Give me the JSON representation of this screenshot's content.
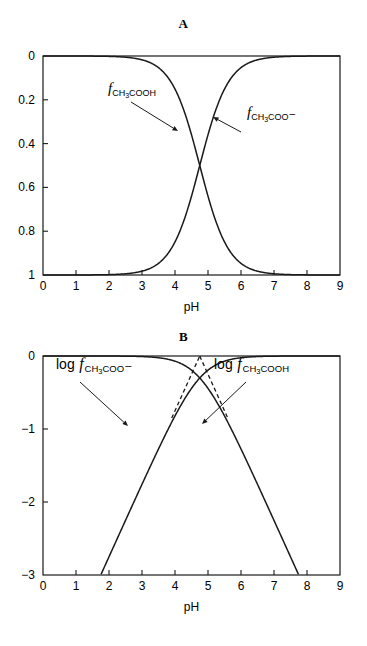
{
  "figure": {
    "panels": [
      {
        "id": "A",
        "title": "A",
        "xlabel": "pH",
        "ylabel": "",
        "labels": [
          {
            "prefix": "",
            "f": "f",
            "formula_main_1": "CH",
            "formula_digit": "3",
            "formula_main_2": "COOH",
            "charge": ""
          },
          {
            "prefix": "",
            "f": "f",
            "formula_main_1": "CH",
            "formula_digit": "3",
            "formula_main_2": "COO",
            "charge": "–"
          }
        ]
      },
      {
        "id": "B",
        "title": "B",
        "xlabel": "pH",
        "ylabel": "",
        "labels": [
          {
            "prefix": "log",
            "f": "f",
            "formula_main_1": "CH",
            "formula_digit": "3",
            "formula_main_2": "COO",
            "charge": "–"
          },
          {
            "prefix": "log",
            "f": "f",
            "formula_main_1": "CH",
            "formula_digit": "3",
            "formula_main_2": "COOH",
            "charge": ""
          }
        ]
      }
    ]
  },
  "chart_data": [
    {
      "type": "line",
      "title": "A",
      "xlabel": "pH",
      "ylabel": "",
      "xlim": [
        0,
        9
      ],
      "ylim": [
        0,
        1
      ],
      "xticks": [
        "0",
        "1",
        "2",
        "3",
        "4",
        "5",
        "6",
        "7",
        "8",
        "9"
      ],
      "yticks": [
        "0",
        "0.2",
        "0.4",
        "0.6",
        "0.8",
        "1"
      ],
      "grid": false,
      "legend_position": "inline-annotation",
      "pKa": 4.75,
      "series": [
        {
          "name": "f_CH3COOH",
          "label_plain": "f CH3COOH",
          "x": [
            0,
            0.5,
            1,
            1.5,
            2,
            2.5,
            3,
            3.25,
            3.5,
            3.75,
            4,
            4.25,
            4.5,
            4.75,
            5,
            5.25,
            5.5,
            5.75,
            6,
            6.25,
            6.5,
            7,
            7.5,
            8,
            8.5,
            9
          ],
          "values": [
            1.0,
            0.9999,
            0.9994,
            0.9982,
            0.9944,
            0.9824,
            0.949,
            0.9194,
            0.8762,
            0.8169,
            0.7403,
            0.6491,
            0.5498,
            0.5,
            0.3597,
            0.2401,
            0.1512,
            0.0909,
            0.0532,
            0.0306,
            0.0174,
            0.0056,
            0.0018,
            0.00056,
            0.00018,
            6e-05
          ]
        },
        {
          "name": "f_CH3COO-",
          "label_plain": "f CH3COO-",
          "x": [
            0,
            0.5,
            1,
            1.5,
            2,
            2.5,
            3,
            3.25,
            3.5,
            3.75,
            4,
            4.25,
            4.5,
            4.75,
            5,
            5.25,
            5.5,
            5.75,
            6,
            6.25,
            6.5,
            7,
            7.5,
            8,
            8.5,
            9
          ],
          "values": [
            2e-05,
            0.0001,
            0.0006,
            0.0018,
            0.0056,
            0.0176,
            0.051,
            0.0806,
            0.1238,
            0.1831,
            0.2597,
            0.3509,
            0.4502,
            0.5,
            0.6403,
            0.7599,
            0.8488,
            0.9091,
            0.9468,
            0.9694,
            0.9826,
            0.9944,
            0.9982,
            0.9994,
            0.9998,
            0.9999
          ]
        }
      ],
      "annotations": [
        {
          "text": "f CH3COOH",
          "points_to": "left descending curve"
        },
        {
          "text": "f CH3COO-",
          "points_to": "right ascending curve"
        }
      ]
    },
    {
      "type": "line",
      "title": "B",
      "xlabel": "pH",
      "ylabel": "",
      "xlim": [
        0,
        9
      ],
      "ylim": [
        -3,
        0
      ],
      "xticks": [
        "0",
        "1",
        "2",
        "3",
        "4",
        "5",
        "6",
        "7",
        "8",
        "9"
      ],
      "yticks": [
        "0",
        "−1",
        "−2",
        "−3"
      ],
      "grid": false,
      "legend_position": "inline-annotation",
      "pKa": 4.75,
      "series": [
        {
          "name": "log f_CH3COO-",
          "label_plain": "log f CH3COO-",
          "x": [
            1.75,
            2,
            2.5,
            3,
            3.5,
            4,
            4.25,
            4.5,
            4.75,
            5,
            5.5,
            6,
            6.5,
            7,
            8,
            9
          ],
          "values": [
            -3.0,
            -2.75,
            -2.25,
            -1.75,
            -1.26,
            -0.79,
            -0.58,
            -0.39,
            -0.3,
            -0.16,
            -0.07,
            -0.024,
            -0.0076,
            -0.0024,
            -0.00024,
            -2e-05
          ]
        },
        {
          "name": "log f_CH3COOH",
          "label_plain": "log f CH3COOH",
          "x": [
            0,
            1,
            2,
            2.5,
            3,
            3.5,
            4,
            4.5,
            4.75,
            5,
            5.25,
            5.5,
            6,
            6.5,
            7,
            7.5,
            7.75
          ],
          "values": [
            -2e-05,
            -0.00024,
            -0.0024,
            -0.0077,
            -0.0227,
            -0.0574,
            -0.129,
            -0.26,
            -0.3,
            -0.444,
            -0.619,
            -0.8206,
            -1.2743,
            -1.7523,
            -2.248,
            -2.746,
            -3.0
          ]
        }
      ],
      "asymptotes": [
        {
          "name": "asymptote-left",
          "x": [
            3.9,
            4.75
          ],
          "values": [
            -0.85,
            0.0
          ],
          "style": "dashed"
        },
        {
          "name": "asymptote-right",
          "x": [
            4.75,
            5.6
          ],
          "values": [
            0.0,
            -0.85
          ],
          "style": "dashed"
        }
      ],
      "annotations": [
        {
          "text": "log f CH3COO-",
          "points_to": "left ascending curve"
        },
        {
          "text": "log f CH3COOH",
          "points_to": "right descending curve"
        }
      ]
    }
  ]
}
